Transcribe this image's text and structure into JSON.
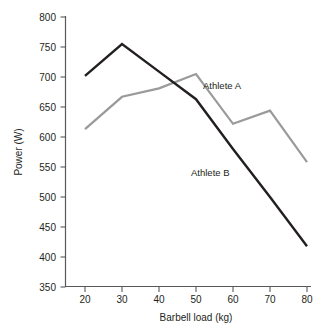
{
  "chart_data": {
    "type": "line",
    "title": "",
    "xlabel": "Barbell load (kg)",
    "ylabel": "Power (W)",
    "x": [
      20,
      30,
      40,
      50,
      60,
      70,
      80
    ],
    "xlim": [
      15,
      85
    ],
    "ylim": [
      350,
      800
    ],
    "xticks": [
      "20",
      "30",
      "40",
      "50",
      "60",
      "70",
      "80"
    ],
    "yticks": [
      "350",
      "400",
      "450",
      "500",
      "550",
      "600",
      "650",
      "700",
      "750",
      "800"
    ],
    "grid": false,
    "legend": "inline-annotations",
    "series": [
      {
        "name": "Athlete A",
        "color": "#9a9a9a",
        "values": [
          613,
          667,
          681,
          705,
          622,
          644,
          558
        ]
      },
      {
        "name": "Athlete B",
        "color": "#231f20",
        "values": [
          702,
          755,
          709,
          663,
          580,
          500,
          418
        ]
      }
    ],
    "annotations": [
      {
        "text": "Athlete A",
        "series": "Athlete A"
      },
      {
        "text": "Athlete B",
        "series": "Athlete B"
      }
    ]
  },
  "axes": {
    "x_title": "Barbell load (kg)",
    "y_title": "Power (W)"
  }
}
